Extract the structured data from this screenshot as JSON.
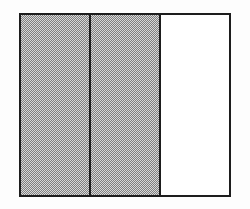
{
  "figure": {
    "shaded_fraction": "2/3",
    "sections": [
      {
        "index": 1,
        "shaded": true
      },
      {
        "index": 2,
        "shaded": true
      },
      {
        "index": 3,
        "shaded": false
      }
    ],
    "colors": {
      "border_color": "#1d1d1d",
      "shade_dark": "#7f7f7f",
      "shade_light": "#d8d8d8",
      "canvas_bg": "#fdfdfd",
      "plain_bg": "#ffffff"
    }
  }
}
